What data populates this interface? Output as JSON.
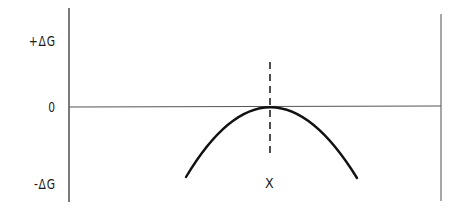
{
  "diagram": {
    "y_axis_labels": {
      "top": "+ΔG",
      "middle": "0",
      "bottom": "-ΔG"
    },
    "x_marker_label": "X",
    "colors": {
      "line": "#1a1a1a",
      "axis": "#555555",
      "background": "#ffffff"
    }
  }
}
